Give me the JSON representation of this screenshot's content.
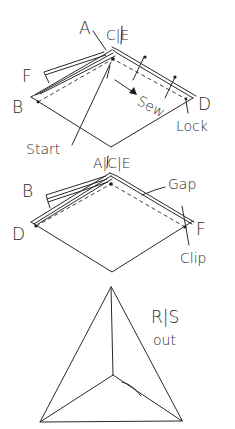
{
  "diagram": {
    "stage1": {
      "labels": {
        "a": "A",
        "ce": "C|E",
        "f": "F",
        "b": "B",
        "d": "D",
        "sew": "Sew",
        "lock": "Lock",
        "start": "Start"
      }
    },
    "stage2": {
      "labels": {
        "ace": "A|C|E",
        "b": "B",
        "d": "D",
        "gap": "Gap",
        "f": "F",
        "clip": "Clip"
      }
    },
    "stage3": {
      "labels": {
        "rs": "R|S",
        "out": "out"
      }
    },
    "colors": {
      "ink": "#2a2a2a",
      "background": "#ffffff"
    }
  }
}
